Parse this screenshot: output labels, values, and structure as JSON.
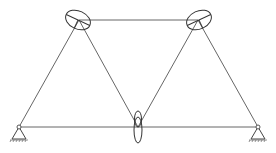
{
  "diagram": {
    "type": "truss-structure-with-stress-ellipses",
    "colors": {
      "line": "#555555",
      "ellipse": "#333333",
      "background": "#ffffff"
    },
    "nodes": [
      {
        "id": "left-support",
        "x": 19,
        "y": 127,
        "kind": "pinned-support"
      },
      {
        "id": "top-left",
        "x": 79,
        "y": 20,
        "kind": "joint"
      },
      {
        "id": "top-right",
        "x": 198,
        "y": 20,
        "kind": "joint"
      },
      {
        "id": "bottom-middle",
        "x": 138,
        "y": 127,
        "kind": "joint"
      },
      {
        "id": "right-support",
        "x": 258,
        "y": 127,
        "kind": "pinned-support"
      }
    ],
    "members": [
      {
        "from": "left-support",
        "to": "top-left"
      },
      {
        "from": "top-left",
        "to": "top-right"
      },
      {
        "from": "top-left",
        "to": "bottom-middle"
      },
      {
        "from": "bottom-middle",
        "to": "top-right"
      },
      {
        "from": "top-right",
        "to": "right-support"
      },
      {
        "from": "left-support",
        "to": "right-support"
      }
    ],
    "ellipses": [
      {
        "node": "top-left",
        "cx": 78,
        "cy": 20,
        "rx": 13,
        "ry": 9,
        "rotate": 25
      },
      {
        "node": "top-right",
        "cx": 199,
        "cy": 20,
        "rx": 13,
        "ry": 9,
        "rotate": -25
      },
      {
        "node": "bottom-middle-upper",
        "cx": 138,
        "cy": 119,
        "rx": 3.5,
        "ry": 8,
        "rotate": 0
      },
      {
        "node": "bottom-middle-lower",
        "cx": 138,
        "cy": 130,
        "rx": 4,
        "ry": 13,
        "rotate": 0
      }
    ]
  }
}
